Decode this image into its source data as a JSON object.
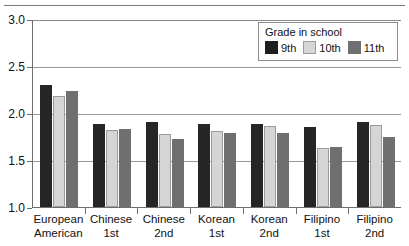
{
  "chart_data": {
    "type": "bar",
    "title": "",
    "xlabel": "",
    "ylabel": "",
    "ylim": [
      1.0,
      3.0
    ],
    "ytick_labels": [
      "1.0",
      "1.5",
      "2.0",
      "2.5",
      "3.0"
    ],
    "ytick_values": [
      1.0,
      1.5,
      2.0,
      2.5,
      3.0
    ],
    "grid": true,
    "legend_position": "top-right",
    "legend_title": "Grade in school",
    "categories": [
      "European American",
      "Chinese 1st",
      "Chinese 2nd",
      "Korean 1st",
      "Korean 2nd",
      "Filipino 1st",
      "Filipino 2nd"
    ],
    "category_lines": [
      [
        "European",
        "American"
      ],
      [
        "Chinese",
        "1st"
      ],
      [
        "Chinese",
        "2nd"
      ],
      [
        "Korean",
        "1st"
      ],
      [
        "Korean",
        "2nd"
      ],
      [
        "Filipino",
        "1st"
      ],
      [
        "Filipino",
        "2nd"
      ]
    ],
    "series": [
      {
        "name": "9th",
        "color": "#262626",
        "values": [
          2.3,
          1.88,
          1.9,
          1.88,
          1.88,
          1.85,
          1.9
        ]
      },
      {
        "name": "10th",
        "color": "#d5d5d5",
        "values": [
          2.18,
          1.82,
          1.78,
          1.81,
          1.86,
          1.63,
          1.87
        ]
      },
      {
        "name": "11th",
        "color": "#6f6f6f",
        "values": [
          2.23,
          1.83,
          1.72,
          1.79,
          1.79,
          1.64,
          1.75
        ]
      }
    ]
  },
  "axis": {
    "y": [
      {
        "label": "3.0",
        "value": 3.0
      },
      {
        "label": "2.5",
        "value": 2.5
      },
      {
        "label": "2.0",
        "value": 2.0
      },
      {
        "label": "1.5",
        "value": 1.5
      },
      {
        "label": "1.0",
        "value": 1.0
      }
    ]
  },
  "legend": {
    "title": "Grade in school",
    "items": [
      {
        "label": "9th",
        "swatch": "series-0-swatch"
      },
      {
        "label": "10th",
        "swatch": "series-1-swatch"
      },
      {
        "label": "11th",
        "swatch": "series-2-swatch"
      }
    ]
  }
}
